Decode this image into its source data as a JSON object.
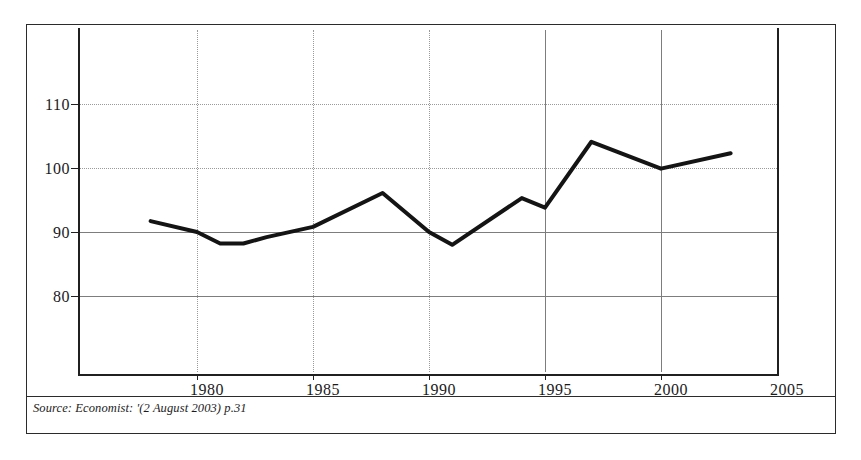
{
  "chart_data": {
    "type": "line",
    "title": "",
    "subtitle": "",
    "xlabel": "",
    "ylabel": "",
    "xlim": [
      1977,
      2005
    ],
    "ylim": [
      74,
      116
    ],
    "xticks": [
      1980,
      1985,
      1990,
      1995,
      2000,
      2005
    ],
    "yticks": [
      80,
      90,
      100,
      110
    ],
    "xtick_labels": [
      "1980",
      "1985",
      "1990",
      "1995",
      "2000",
      "2005"
    ],
    "ytick_labels": [
      "80",
      "90",
      "100",
      "110"
    ],
    "grid": true,
    "grid_style": "dotted-and-solid",
    "legend": null,
    "legend_position": "none",
    "line_color": "#141414",
    "line_width": 4,
    "series": [
      {
        "name": "index",
        "x": [
          1978,
          1980,
          1981,
          1982,
          1983,
          1985,
          1988,
          1990,
          1991,
          1994,
          1995,
          1997,
          2000,
          2003
        ],
        "values": [
          91.7,
          90.0,
          88.2,
          88.2,
          89.2,
          90.8,
          96.1,
          90.0,
          88.0,
          95.3,
          93.8,
          104.1,
          99.9,
          102.3
        ]
      }
    ],
    "annotations": [],
    "source_note": "Source: Economist: '(2 August 2003) p.31"
  },
  "figure": {
    "source_label": "Source: Economist: '(2 August 2003) p.31"
  },
  "axes": {
    "y_labels": [
      "110",
      "100",
      "90",
      "80"
    ],
    "x_labels": [
      "1980",
      "1985",
      "1990",
      "1995",
      "2000",
      "2005"
    ]
  }
}
